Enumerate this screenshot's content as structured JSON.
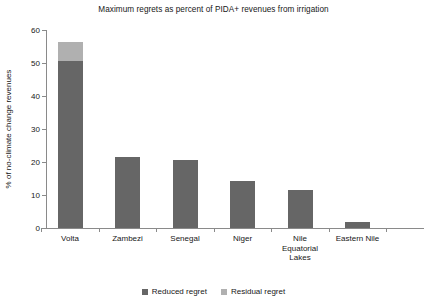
{
  "chart_data": {
    "type": "bar",
    "title": "Maximum regrets as percent of PIDA+ revenues from irrigation",
    "xlabel": "",
    "ylabel": "% of no-climate change revenues",
    "ylim": [
      0,
      60
    ],
    "yticks": [
      0,
      10,
      20,
      30,
      40,
      50,
      60
    ],
    "grid": false,
    "stacked": true,
    "legend_position": "bottom-center",
    "categories": [
      "Volta",
      "Zambezi",
      "Senegal",
      "Niger",
      "Nile Equatorial Lakes",
      "Eastern Nile"
    ],
    "category_label_lines": [
      [
        "Volta"
      ],
      [
        "Zambezi"
      ],
      [
        "Senegal"
      ],
      [
        "Niger"
      ],
      [
        "Nile",
        "Equatorial",
        "Lakes"
      ],
      [
        "Eastern Nile"
      ]
    ],
    "series": [
      {
        "name": "Reduced regret",
        "color": "#666666",
        "values": [
          50.6,
          21.5,
          20.5,
          14.2,
          11.5,
          1.8
        ]
      },
      {
        "name": "Residual regret",
        "color": "#b0b0b0",
        "values": [
          5.8,
          0,
          0,
          0,
          0,
          0
        ]
      }
    ],
    "totals": [
      56.4,
      21.5,
      20.5,
      14.2,
      11.5,
      1.8
    ]
  },
  "legend": {
    "items": [
      {
        "label": "Reduced regret",
        "color": "#666666"
      },
      {
        "label": "Residual regret",
        "color": "#b0b0b0"
      }
    ]
  },
  "colors": {
    "reduced_regret": "#666666",
    "residual_regret": "#b0b0b0",
    "axis": "#8a8a8a",
    "text": "#171717",
    "background": "#ffffff"
  }
}
